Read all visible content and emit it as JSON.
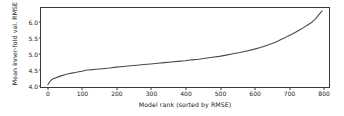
{
  "chart_data": {
    "type": "line",
    "title": "",
    "xlabel": "Model rank (sorted by RMSE)",
    "ylabel": "Mean inner-fold val. RMSE",
    "xlim": [
      -20,
      820
    ],
    "ylim": [
      3.92,
      6.42
    ],
    "grid": false,
    "legend": null,
    "xticks": [
      0,
      100,
      200,
      300,
      400,
      500,
      600,
      700,
      800
    ],
    "xtick_labels": [
      "0",
      "100",
      "200",
      "300",
      "400",
      "500",
      "600",
      "700",
      "800"
    ],
    "yticks": [
      4.0,
      4.5,
      5.0,
      5.5,
      6.0
    ],
    "ytick_labels": [
      "4.0",
      "4.5",
      "5.0",
      "5.5",
      "6.0"
    ],
    "line_color": "#4a4a4a",
    "line_width": 1.1,
    "series": [
      {
        "name": "Mean inner-fold val. RMSE",
        "x": [
          0,
          5,
          10,
          15,
          20,
          30,
          40,
          50,
          60,
          70,
          80,
          90,
          100,
          110,
          120,
          130,
          140,
          150,
          160,
          180,
          200,
          220,
          240,
          260,
          280,
          300,
          320,
          340,
          360,
          380,
          400,
          420,
          440,
          460,
          480,
          500,
          520,
          540,
          560,
          580,
          600,
          620,
          640,
          650,
          660,
          670,
          680,
          690,
          700,
          710,
          720,
          730,
          740,
          750,
          760,
          770,
          780,
          790,
          800
        ],
        "values": [
          3.99,
          4.08,
          4.14,
          4.18,
          4.2,
          4.24,
          4.28,
          4.31,
          4.34,
          4.36,
          4.38,
          4.4,
          4.42,
          4.45,
          4.46,
          4.47,
          4.48,
          4.49,
          4.5,
          4.52,
          4.55,
          4.57,
          4.59,
          4.61,
          4.63,
          4.65,
          4.67,
          4.69,
          4.71,
          4.73,
          4.75,
          4.78,
          4.8,
          4.83,
          4.86,
          4.89,
          4.93,
          4.97,
          5.01,
          5.06,
          5.11,
          5.17,
          5.24,
          5.28,
          5.32,
          5.37,
          5.42,
          5.47,
          5.53,
          5.58,
          5.64,
          5.7,
          5.76,
          5.83,
          5.9,
          5.97,
          6.07,
          6.2,
          6.33
        ]
      }
    ]
  },
  "axis": {
    "x_label": "Model rank (sorted by RMSE)",
    "y_label": "Mean inner-fold val. RMSE"
  }
}
